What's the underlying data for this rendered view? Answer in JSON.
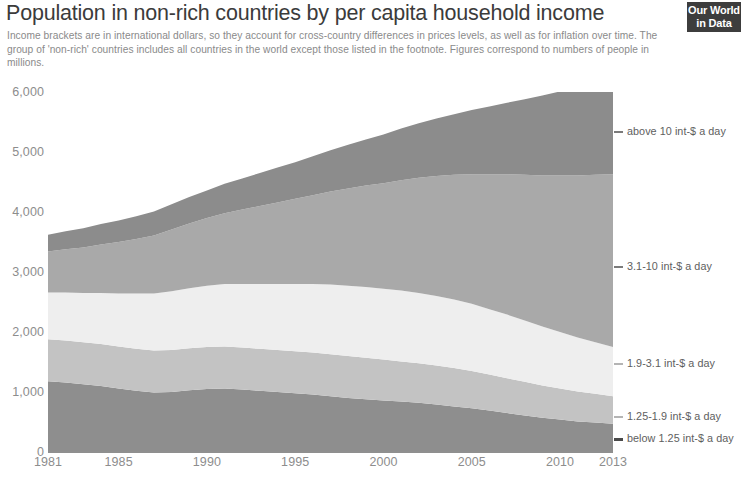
{
  "header": {
    "title": "Population in non-rich countries by per capita household income",
    "subtitle": "Income brackets are in international dollars, so they account for cross-country differences in prices levels, as well as for inflation over time. The group of 'non-rich' countries includes all countries in the world except those listed in the footnote. Figures correspond to numbers of people in millions.",
    "logo_line1": "Our World",
    "logo_line2": "in Data"
  },
  "chart_data": {
    "type": "area",
    "title": "Population in non-rich countries by per capita household income",
    "subtitle": "Income brackets are in international dollars, so they account for cross-country differences in prices levels, as well as for inflation over time. The group of 'non-rich' countries includes all countries in the world except those listed in the footnote. Figures correspond to numbers of people in millions.",
    "xlabel": "",
    "ylabel": "",
    "stacked": true,
    "grid": false,
    "legend_position": "right",
    "xlim": [
      1981,
      2013
    ],
    "ylim": [
      0,
      6000
    ],
    "x_tick_labels": [
      "1981",
      "1985",
      "1990",
      "1995",
      "2000",
      "2005",
      "2010",
      "2013"
    ],
    "x_ticks": [
      1981,
      1985,
      1990,
      1995,
      2000,
      2005,
      2010,
      2013
    ],
    "y_tick_labels": [
      "0",
      "1,000",
      "2,000",
      "3,000",
      "4,000",
      "5,000",
      "6,000"
    ],
    "y_ticks": [
      0,
      1000,
      2000,
      3000,
      4000,
      5000,
      6000
    ],
    "x": [
      1981,
      1982,
      1983,
      1984,
      1985,
      1986,
      1987,
      1988,
      1989,
      1990,
      1991,
      1992,
      1993,
      1994,
      1995,
      1996,
      1997,
      1998,
      1999,
      2000,
      2001,
      2002,
      2003,
      2004,
      2005,
      2006,
      2007,
      2008,
      2009,
      2010,
      2011,
      2012,
      2013
    ],
    "series": [
      {
        "name": "below 1.25 int-$ a day",
        "color": "#8e8e8e",
        "values": [
          1180,
          1160,
          1130,
          1100,
          1060,
          1020,
          990,
          1000,
          1030,
          1050,
          1060,
          1040,
          1020,
          1000,
          980,
          960,
          930,
          900,
          880,
          860,
          840,
          820,
          790,
          760,
          730,
          690,
          650,
          610,
          570,
          540,
          510,
          490,
          470
        ]
      },
      {
        "name": "1.25-1.9 int-$ a day",
        "color": "#c3c3c3",
        "values": [
          700,
          700,
          700,
          700,
          700,
          700,
          700,
          700,
          700,
          700,
          700,
          700,
          700,
          700,
          700,
          700,
          700,
          700,
          690,
          680,
          670,
          660,
          650,
          640,
          620,
          600,
          580,
          560,
          540,
          520,
          500,
          480,
          460
        ]
      },
      {
        "name": "1.9-3.1 int-$ a day",
        "color": "#eeeeee",
        "values": [
          780,
          800,
          820,
          850,
          880,
          920,
          950,
          980,
          1000,
          1020,
          1040,
          1060,
          1080,
          1100,
          1120,
          1140,
          1160,
          1170,
          1180,
          1180,
          1180,
          1170,
          1160,
          1140,
          1120,
          1090,
          1060,
          1020,
          980,
          940,
          900,
          860,
          820
        ]
      },
      {
        "name": "3.1-10 int-$ a day",
        "color": "#a9a9a9",
        "values": [
          680,
          720,
          760,
          810,
          860,
          910,
          970,
          1030,
          1080,
          1130,
          1180,
          1240,
          1300,
          1360,
          1420,
          1480,
          1550,
          1620,
          1690,
          1760,
          1840,
          1920,
          2000,
          2080,
          2160,
          2250,
          2340,
          2430,
          2520,
          2610,
          2700,
          2790,
          2880
        ]
      },
      {
        "name": "above 10 int-$ a day",
        "color": "#8c8c8c",
        "values": [
          280,
          300,
          320,
          340,
          360,
          380,
          400,
          420,
          440,
          460,
          490,
          520,
          550,
          580,
          610,
          650,
          690,
          730,
          770,
          810,
          860,
          910,
          960,
          1010,
          1070,
          1130,
          1190,
          1260,
          1330,
          1400,
          1470,
          1550,
          1630
        ]
      }
    ]
  },
  "legend": {
    "entries": [
      {
        "label": "above 10 int-$ a day",
        "top": 33,
        "style": "normal"
      },
      {
        "label": "3.1-10 int-$ a day",
        "top": 168,
        "style": "normal"
      },
      {
        "label": "1.9-3.1 int-$ a day",
        "top": 265,
        "style": "faint"
      },
      {
        "label": "1.25-1.9 int-$ a day",
        "top": 318,
        "style": "faint"
      },
      {
        "label": "below 1.25 int-$ a day",
        "top": 340,
        "style": "bold"
      }
    ]
  }
}
